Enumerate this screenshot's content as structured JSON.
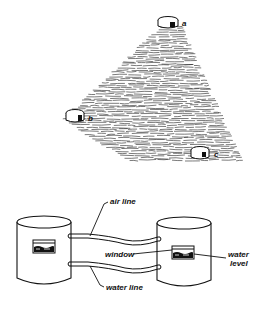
{
  "figure": {
    "top_panel": {
      "description": "Three water-level gauges placed at points on a sloping surface",
      "points": [
        {
          "id": "a",
          "label": "a"
        },
        {
          "id": "b",
          "label": "b"
        },
        {
          "id": "c",
          "label": "c"
        }
      ]
    },
    "bottom_panel": {
      "description": "Two connected tanks with air line and water line",
      "labels": {
        "air_line": "air line",
        "window": "window",
        "water_level_1": "water",
        "water_level_2": "level",
        "water_line": "water line"
      }
    },
    "colors": {
      "ink": "#111111",
      "background": "#ffffff"
    }
  }
}
